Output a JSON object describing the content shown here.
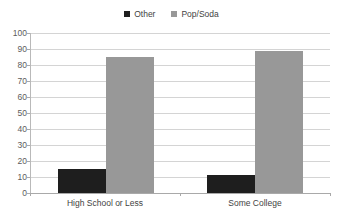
{
  "chart_data": {
    "type": "bar",
    "title": "",
    "xlabel": "",
    "ylabel": "",
    "categories": [
      "High School or Less",
      "Some College"
    ],
    "series": [
      {
        "name": "Other",
        "color": "#1a1a1a",
        "values": [
          15,
          11
        ]
      },
      {
        "name": "Pop/Soda",
        "color": "#969696",
        "values": [
          85,
          89
        ]
      }
    ],
    "ylim": [
      0,
      100
    ],
    "ytick_step": 10,
    "yticks": [
      100,
      90,
      80,
      70,
      60,
      50,
      40,
      30,
      20,
      10,
      0
    ],
    "grid": true,
    "legend_position": "top-center"
  },
  "legend": {
    "items": [
      {
        "label": "Other",
        "swatch_color": "#1a1a1a",
        "icon": "square-swatch-icon"
      },
      {
        "label": "Pop/Soda",
        "swatch_color": "#969696",
        "icon": "square-swatch-icon"
      }
    ]
  },
  "axis": {
    "y_tick_labels": [
      "100",
      "90",
      "80",
      "70",
      "60",
      "50",
      "40",
      "30",
      "20",
      "10",
      "0"
    ],
    "x_tick_labels": [
      "High School or Less",
      "Some College"
    ]
  },
  "colors": {
    "series_other": "#1a1a1a",
    "series_popsoda": "#969696",
    "gridline": "#d4d4d4",
    "axis": "#a8a8a8",
    "text": "#3d3d3d",
    "background": "#ffffff"
  }
}
